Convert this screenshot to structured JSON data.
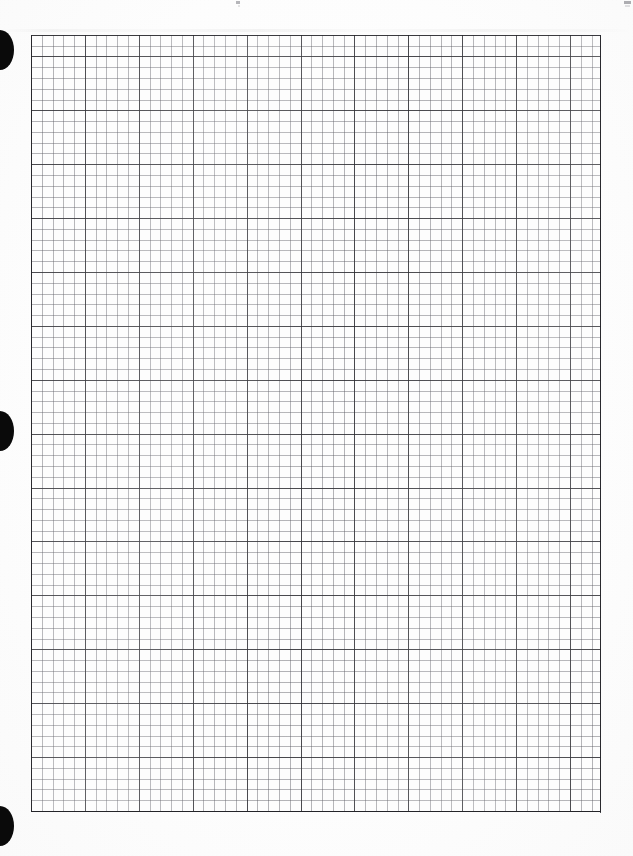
{
  "document": {
    "kind": "scanned-graph-paper",
    "title": "Scanned graph paper sheet",
    "page_width": 633,
    "page_height": 856,
    "background_color": "#fdfdfd",
    "has_visible_text": false
  },
  "grid": {
    "name": "graph-paper-grid",
    "left": 31,
    "top": 35,
    "width": 570,
    "height": 777,
    "minor_cell_px": 10.78,
    "major_cell_px": 53.9,
    "minor_cells_per_major": 5,
    "minor_columns": 53,
    "minor_rows": 72,
    "major_columns": 11,
    "major_rows": 14,
    "minor_line_color": "#5a5a62",
    "major_line_color": "#282a2d",
    "border_color": "#232328"
  },
  "punch_marks": {
    "name": "binder-punch-marks",
    "count": 3,
    "color": "#0a0a0a",
    "edge": "left",
    "items": [
      {
        "label": "top-punch-mark",
        "top": 30,
        "height": 40
      },
      {
        "label": "middle-punch-mark",
        "top": 411,
        "height": 40
      },
      {
        "label": "bottom-punch-mark",
        "top": 806,
        "height": 40
      }
    ]
  },
  "scan_artifacts": {
    "name": "scanner-artifacts",
    "specks": [
      {
        "label": "top-center-speck",
        "left": 236,
        "top": 1,
        "color": "#8b8b92"
      },
      {
        "label": "top-right-speck",
        "left": 624,
        "top": 1,
        "color": "#8b8b92"
      }
    ],
    "smudge_band": {
      "label": "top-smudge-band",
      "top": 29,
      "height": 3
    }
  }
}
